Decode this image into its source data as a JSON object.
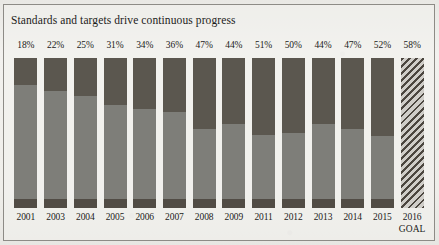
{
  "chart_data": {
    "type": "bar",
    "title": "Standards and targets drive continuous progress",
    "xlabel": "",
    "ylabel": "",
    "ylim": [
      0,
      100
    ],
    "grid": false,
    "legend": "none",
    "categories": [
      "2001",
      "2003",
      "2004",
      "2005",
      "2006",
      "2007",
      "2008",
      "2009",
      "2011",
      "2012",
      "2013",
      "2014",
      "2015",
      "2016"
    ],
    "category_sublabels": [
      "",
      "",
      "",
      "",
      "",
      "",
      "",
      "",
      "",
      "",
      "",
      "",
      "",
      "GOAL"
    ],
    "values": [
      18,
      22,
      25,
      31,
      34,
      36,
      47,
      44,
      51,
      50,
      44,
      47,
      52,
      58
    ],
    "data_labels": [
      "18%",
      "22%",
      "25%",
      "31%",
      "34%",
      "36%",
      "47%",
      "44%",
      "51%",
      "50%",
      "44%",
      "47%",
      "52%",
      "58%"
    ],
    "bar_styles": [
      "solid",
      "solid",
      "solid",
      "solid",
      "solid",
      "solid",
      "solid",
      "solid",
      "solid",
      "solid",
      "solid",
      "solid",
      "solid",
      "hatched"
    ]
  },
  "colors": {
    "fill_dark": "#5b574f",
    "fill_medium": "#7e7e79",
    "fill_base": "#514c45",
    "hatch_dark": "#4b463f",
    "hatch_light": "#cfcdc8",
    "frame": "#8d8b86",
    "paper": "#efeeeb",
    "text": "#1b1b19"
  }
}
